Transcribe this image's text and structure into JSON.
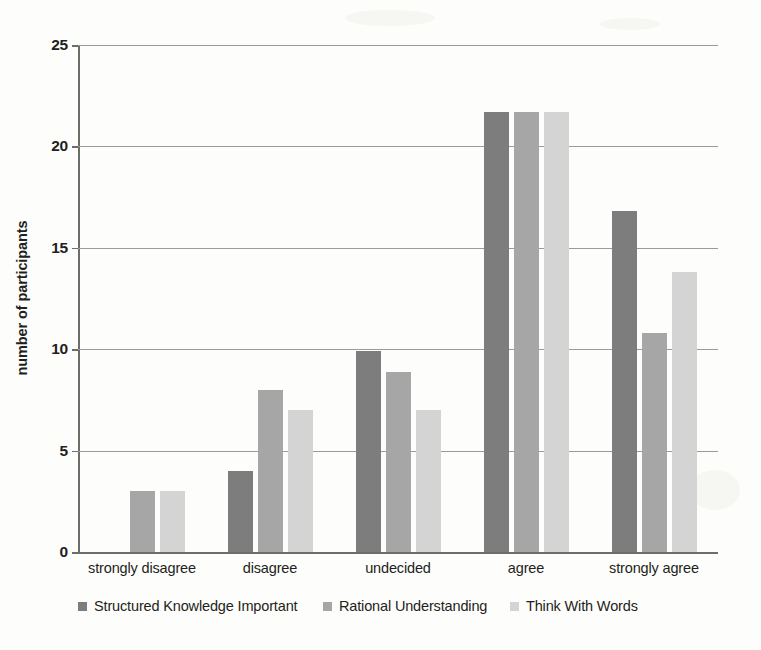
{
  "chart_data": {
    "type": "bar",
    "title": "",
    "xlabel": "",
    "ylabel": "number of participants",
    "ylim": [
      0,
      25
    ],
    "yticks": [
      0,
      5,
      10,
      15,
      20,
      25
    ],
    "ytick_labels": [
      "0",
      "5",
      "10",
      "15",
      "20",
      "25"
    ],
    "grid": true,
    "legend_position": "bottom",
    "categories": [
      "strongly disagree",
      "disagree",
      "undecided",
      "agree",
      "strongly agree"
    ],
    "series": [
      {
        "name": "Structured Knowledge Important",
        "color": "#7d7d7d",
        "values": [
          0,
          4,
          9.9,
          21.7,
          16.8
        ]
      },
      {
        "name": "Rational Understanding",
        "color": "#a6a6a6",
        "values": [
          3,
          8,
          8.9,
          21.7,
          10.8
        ]
      },
      {
        "name": "Think With Words",
        "color": "#d4d4d4",
        "values": [
          3,
          7,
          7,
          21.7,
          13.8
        ]
      }
    ]
  },
  "axis": {
    "y_title": "number of participants"
  },
  "legend": {
    "items": [
      {
        "label": "Structured Knowledge Important",
        "color": "#7d7d7d"
      },
      {
        "label": "Rational Understanding",
        "color": "#a6a6a6"
      },
      {
        "label": "Think With Words",
        "color": "#d4d4d4"
      }
    ]
  }
}
